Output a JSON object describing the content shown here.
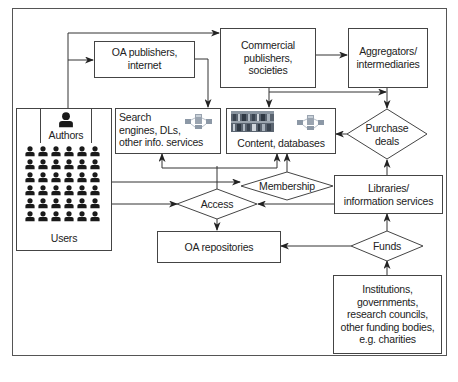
{
  "diagram": {
    "frame_color": "#444444",
    "nodes": {
      "oa_publishers": {
        "label": "OA publishers, internet",
        "line1": "OA publishers,",
        "line2": "internet"
      },
      "commercial_publishers": {
        "line1": "Commercial",
        "line2": "publishers,",
        "line3": "societies"
      },
      "aggregators": {
        "line1": "Aggregators/",
        "line2": "intermediaries"
      },
      "authors": {
        "label": "Authors",
        "icon": "person-icon"
      },
      "users": {
        "label": "Users",
        "icon": "people-grid-icon",
        "rows": 6,
        "cols": 6
      },
      "search_engines": {
        "line1": "Search",
        "line2": "engines, DLs,",
        "line3": "other info. services",
        "icon": "network-servers-icon"
      },
      "content_databases": {
        "label": "Content, databases",
        "image": "bookshelf-image",
        "icon": "network-servers-icon"
      },
      "purchase_deals": {
        "line1": "Purchase",
        "line2": "deals"
      },
      "membership": {
        "label": "Membership"
      },
      "access": {
        "label": "Access"
      },
      "libraries": {
        "line1": "Libraries/",
        "line2": "information services"
      },
      "oa_repositories": {
        "label": "OA repositories"
      },
      "funds": {
        "label": "Funds"
      },
      "institutions": {
        "line1": "Institutions,",
        "line2": "governments,",
        "line3": "research councils,",
        "line4": "other funding bodies,",
        "line5": "e.g. charities"
      }
    },
    "edges": [
      {
        "from": "authors",
        "to": "oa_publishers"
      },
      {
        "from": "authors",
        "to": "commercial_publishers"
      },
      {
        "from": "oa_publishers",
        "to": "search_engines"
      },
      {
        "from": "commercial_publishers",
        "to": "aggregators"
      },
      {
        "from": "commercial_publishers",
        "to": "content_databases"
      },
      {
        "from": "commercial_publishers",
        "to": "purchase_deals"
      },
      {
        "from": "aggregators",
        "to": "purchase_deals"
      },
      {
        "from": "purchase_deals",
        "to": "content_databases"
      },
      {
        "from": "libraries",
        "to": "purchase_deals"
      },
      {
        "from": "users",
        "to": "membership"
      },
      {
        "from": "membership",
        "to": "content_databases"
      },
      {
        "from": "users",
        "to": "access"
      },
      {
        "from": "access",
        "to": "search_engines"
      },
      {
        "from": "access",
        "to": "content_databases"
      },
      {
        "from": "access",
        "to": "oa_repositories"
      },
      {
        "from": "libraries",
        "to": "access"
      },
      {
        "from": "funds",
        "to": "oa_repositories"
      },
      {
        "from": "funds",
        "to": "libraries"
      },
      {
        "from": "institutions",
        "to": "funds"
      }
    ]
  }
}
